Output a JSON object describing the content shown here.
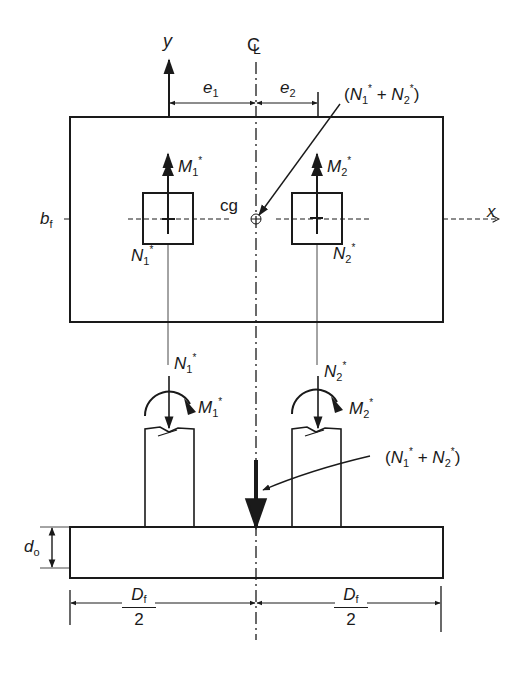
{
  "diagram": {
    "colors": {
      "line": "#1a1a1a",
      "background": "#ffffff"
    },
    "labels": {
      "y_axis": "y",
      "x_axis": "x",
      "centerline": "CL",
      "e1": {
        "main": "e",
        "sub": "1"
      },
      "e2": {
        "main": "e",
        "sub": "2"
      },
      "cg": "cg",
      "bf": {
        "main": "b",
        "sub": "f"
      },
      "do": {
        "main": "d",
        "sub": "o"
      },
      "resultant_top": {
        "open": "(",
        "n1": "N",
        "n1_sub": "1",
        "star": "*",
        "plus": " + ",
        "n2": "N",
        "n2_sub": "2",
        "close": ")"
      },
      "resultant_bottom": {
        "open": "(",
        "n1": "N",
        "n1_sub": "1",
        "star": "*",
        "plus": " + ",
        "n2": "N",
        "n2_sub": "2",
        "close": ")"
      },
      "plan_M1": {
        "main": "M",
        "sub": "1",
        "star": "*"
      },
      "plan_M2": {
        "main": "M",
        "sub": "2",
        "star": "*"
      },
      "plan_N1": {
        "main": "N",
        "sub": "1",
        "star": "*"
      },
      "plan_N2": {
        "main": "N",
        "sub": "2",
        "star": "*"
      },
      "elev_N1": {
        "main": "N",
        "sub": "1",
        "star": "*"
      },
      "elev_N2": {
        "main": "N",
        "sub": "2",
        "star": "*"
      },
      "elev_M1": {
        "main": "M",
        "sub": "1",
        "star": "*"
      },
      "elev_M2": {
        "main": "M",
        "sub": "2",
        "star": "*"
      },
      "df_left": {
        "num_main": "D",
        "num_sub": "f",
        "den": "2"
      },
      "df_right": {
        "num_main": "D",
        "num_sub": "f",
        "den": "2"
      }
    }
  }
}
